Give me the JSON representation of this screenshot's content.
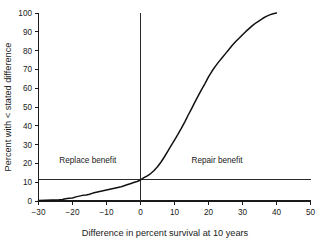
{
  "chart_data": {
    "type": "line",
    "title": "",
    "subtitle": "",
    "xlabel": "Difference in percent survival at 10 years",
    "ylabel": "Percent with < stated difference",
    "xlim": [
      -30,
      50
    ],
    "ylim": [
      0,
      100
    ],
    "xticks": [
      -30,
      -20,
      -10,
      0,
      10,
      20,
      30,
      40,
      50
    ],
    "xtick_labels": [
      "−30",
      "−20",
      "−10",
      "0",
      "10",
      "20",
      "30",
      "40",
      "50"
    ],
    "yticks": [
      0,
      10,
      20,
      30,
      40,
      50,
      60,
      70,
      80,
      90,
      100
    ],
    "ytick_labels": [
      "0",
      "10",
      "20",
      "30",
      "40",
      "50",
      "60",
      "70",
      "80",
      "90",
      "100"
    ],
    "grid": false,
    "legend": "none",
    "series": [
      {
        "name": "Cumulative percent with less than stated difference",
        "x": [
          -30,
          -28,
          -26,
          -24,
          -23,
          -22,
          -21,
          -20,
          -19,
          -18,
          -17,
          -16,
          -15,
          -14,
          -13,
          -12,
          -11,
          -10,
          -9,
          -8,
          -7,
          -6,
          -5,
          -4,
          -3,
          -2,
          -1,
          0,
          1,
          2,
          3,
          4,
          5,
          6,
          7,
          8,
          9,
          10,
          11,
          12,
          13,
          14,
          15,
          16,
          17,
          18,
          19,
          20,
          21,
          22,
          23,
          24,
          25,
          26,
          27,
          28,
          29,
          30,
          31,
          32,
          33,
          34,
          35,
          36,
          37,
          38,
          39,
          40
        ],
        "y": [
          0.3,
          0.4,
          0.5,
          0.6,
          0.8,
          1.2,
          1.4,
          1.6,
          2.2,
          2.6,
          3.0,
          3.2,
          3.6,
          4.2,
          4.6,
          5.0,
          5.4,
          5.8,
          6.2,
          6.6,
          7.0,
          7.4,
          8.0,
          8.6,
          9.2,
          9.8,
          10.4,
          11.2,
          12.4,
          13.4,
          14.6,
          16.2,
          18.2,
          20.6,
          23.4,
          26.4,
          29.4,
          32.4,
          35.4,
          38.6,
          42.0,
          45.6,
          49.0,
          52.6,
          56.0,
          59.4,
          62.6,
          66.0,
          69.0,
          71.6,
          74.0,
          76.2,
          78.4,
          80.6,
          82.8,
          84.8,
          86.6,
          88.4,
          90.2,
          91.8,
          93.4,
          94.8,
          96.0,
          97.2,
          98.2,
          99.0,
          99.6,
          100.0
        ]
      }
    ],
    "reference_lines": [
      {
        "name": "zero-difference-vertical",
        "orientation": "vertical",
        "value": 0
      },
      {
        "name": "threshold-horizontal",
        "orientation": "horizontal",
        "value": 11.2
      }
    ],
    "annotations": [
      {
        "name": "replace-benefit-label",
        "text": "Replace benefit",
        "x": -15.5,
        "y": 20
      },
      {
        "name": "repair-benefit-label",
        "text": "Repair benefit",
        "x": 22.5,
        "y": 20
      }
    ],
    "colors": {
      "curve": "#111111",
      "axis": "#1a1a1a",
      "reference": "#2a2a2a",
      "background": "#ffffff"
    }
  }
}
